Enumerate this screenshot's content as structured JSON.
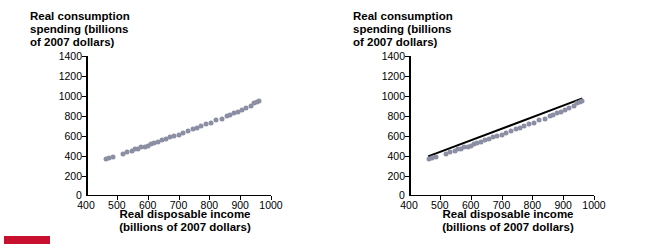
{
  "chart_data": [
    {
      "type": "scatter",
      "panel": "left",
      "title": "",
      "ylabel": "Real consumption spending (billions of 2007 dollars)",
      "xlabel": "Real disposable income (billions of 2007 dollars)",
      "xlim": [
        400,
        1000
      ],
      "ylim": [
        0,
        1400
      ],
      "xticks": [
        400,
        500,
        600,
        700,
        800,
        900,
        1000
      ],
      "yticks": [
        0,
        200,
        400,
        600,
        800,
        1000,
        1200,
        1400
      ],
      "grid": false,
      "legend": "none",
      "marker_color": "#8c8fa3",
      "trendline": false,
      "points": [
        {
          "x": 466,
          "y": 400
        },
        {
          "x": 474,
          "y": 408
        },
        {
          "x": 486,
          "y": 414
        },
        {
          "x": 520,
          "y": 450
        },
        {
          "x": 534,
          "y": 466
        },
        {
          "x": 548,
          "y": 472
        },
        {
          "x": 560,
          "y": 492
        },
        {
          "x": 570,
          "y": 498
        },
        {
          "x": 578,
          "y": 514
        },
        {
          "x": 592,
          "y": 520
        },
        {
          "x": 600,
          "y": 530
        },
        {
          "x": 612,
          "y": 548
        },
        {
          "x": 622,
          "y": 560
        },
        {
          "x": 634,
          "y": 566
        },
        {
          "x": 646,
          "y": 584
        },
        {
          "x": 660,
          "y": 596
        },
        {
          "x": 672,
          "y": 612
        },
        {
          "x": 686,
          "y": 628
        },
        {
          "x": 700,
          "y": 640
        },
        {
          "x": 714,
          "y": 660
        },
        {
          "x": 730,
          "y": 672
        },
        {
          "x": 746,
          "y": 696
        },
        {
          "x": 760,
          "y": 706
        },
        {
          "x": 772,
          "y": 722
        },
        {
          "x": 790,
          "y": 744
        },
        {
          "x": 806,
          "y": 760
        },
        {
          "x": 822,
          "y": 782
        },
        {
          "x": 840,
          "y": 800
        },
        {
          "x": 856,
          "y": 824
        },
        {
          "x": 868,
          "y": 836
        },
        {
          "x": 880,
          "y": 860
        },
        {
          "x": 892,
          "y": 870
        },
        {
          "x": 906,
          "y": 890
        },
        {
          "x": 920,
          "y": 908
        },
        {
          "x": 934,
          "y": 928
        },
        {
          "x": 946,
          "y": 952
        },
        {
          "x": 954,
          "y": 966
        },
        {
          "x": 960,
          "y": 974
        }
      ]
    },
    {
      "type": "scatter",
      "panel": "right",
      "title": "",
      "ylabel": "Real consumption spending (billions of 2007 dollars)",
      "xlabel": "Real disposable income (billions of 2007 dollars)",
      "xlim": [
        400,
        1000
      ],
      "ylim": [
        0,
        1400
      ],
      "xticks": [
        400,
        500,
        600,
        700,
        800,
        900,
        1000
      ],
      "yticks": [
        0,
        200,
        400,
        600,
        800,
        1000,
        1200,
        1400
      ],
      "grid": false,
      "legend": "none",
      "marker_color": "#8c8fa3",
      "trendline": true,
      "trendline_color": "#000000",
      "trendline_endpoints": [
        {
          "x": 462,
          "y": 396
        },
        {
          "x": 962,
          "y": 976
        }
      ],
      "points": [
        {
          "x": 466,
          "y": 400
        },
        {
          "x": 474,
          "y": 408
        },
        {
          "x": 486,
          "y": 414
        },
        {
          "x": 520,
          "y": 450
        },
        {
          "x": 534,
          "y": 466
        },
        {
          "x": 548,
          "y": 472
        },
        {
          "x": 560,
          "y": 492
        },
        {
          "x": 570,
          "y": 498
        },
        {
          "x": 578,
          "y": 514
        },
        {
          "x": 592,
          "y": 520
        },
        {
          "x": 600,
          "y": 530
        },
        {
          "x": 612,
          "y": 548
        },
        {
          "x": 622,
          "y": 560
        },
        {
          "x": 634,
          "y": 566
        },
        {
          "x": 646,
          "y": 584
        },
        {
          "x": 660,
          "y": 596
        },
        {
          "x": 672,
          "y": 612
        },
        {
          "x": 686,
          "y": 628
        },
        {
          "x": 700,
          "y": 640
        },
        {
          "x": 714,
          "y": 660
        },
        {
          "x": 730,
          "y": 672
        },
        {
          "x": 746,
          "y": 696
        },
        {
          "x": 760,
          "y": 706
        },
        {
          "x": 772,
          "y": 722
        },
        {
          "x": 790,
          "y": 744
        },
        {
          "x": 806,
          "y": 760
        },
        {
          "x": 822,
          "y": 782
        },
        {
          "x": 840,
          "y": 800
        },
        {
          "x": 856,
          "y": 824
        },
        {
          "x": 868,
          "y": 836
        },
        {
          "x": 880,
          "y": 860
        },
        {
          "x": 892,
          "y": 870
        },
        {
          "x": 906,
          "y": 890
        },
        {
          "x": 920,
          "y": 908
        },
        {
          "x": 934,
          "y": 928
        },
        {
          "x": 946,
          "y": 952
        },
        {
          "x": 954,
          "y": 966
        },
        {
          "x": 960,
          "y": 974
        }
      ]
    }
  ],
  "labels": {
    "ylabel_line1": "Real consumption",
    "ylabel_line2": "spending (billions",
    "ylabel_line3": "of 2007 dollars)",
    "xlabel_line1": "Real disposable income",
    "xlabel_line2": "(billions of 2007 dollars)",
    "zero": "0"
  },
  "colors": {
    "marker": "#8c8fa3",
    "trendline": "#000000",
    "axis": "#000000",
    "swatch": "#c8102e"
  }
}
